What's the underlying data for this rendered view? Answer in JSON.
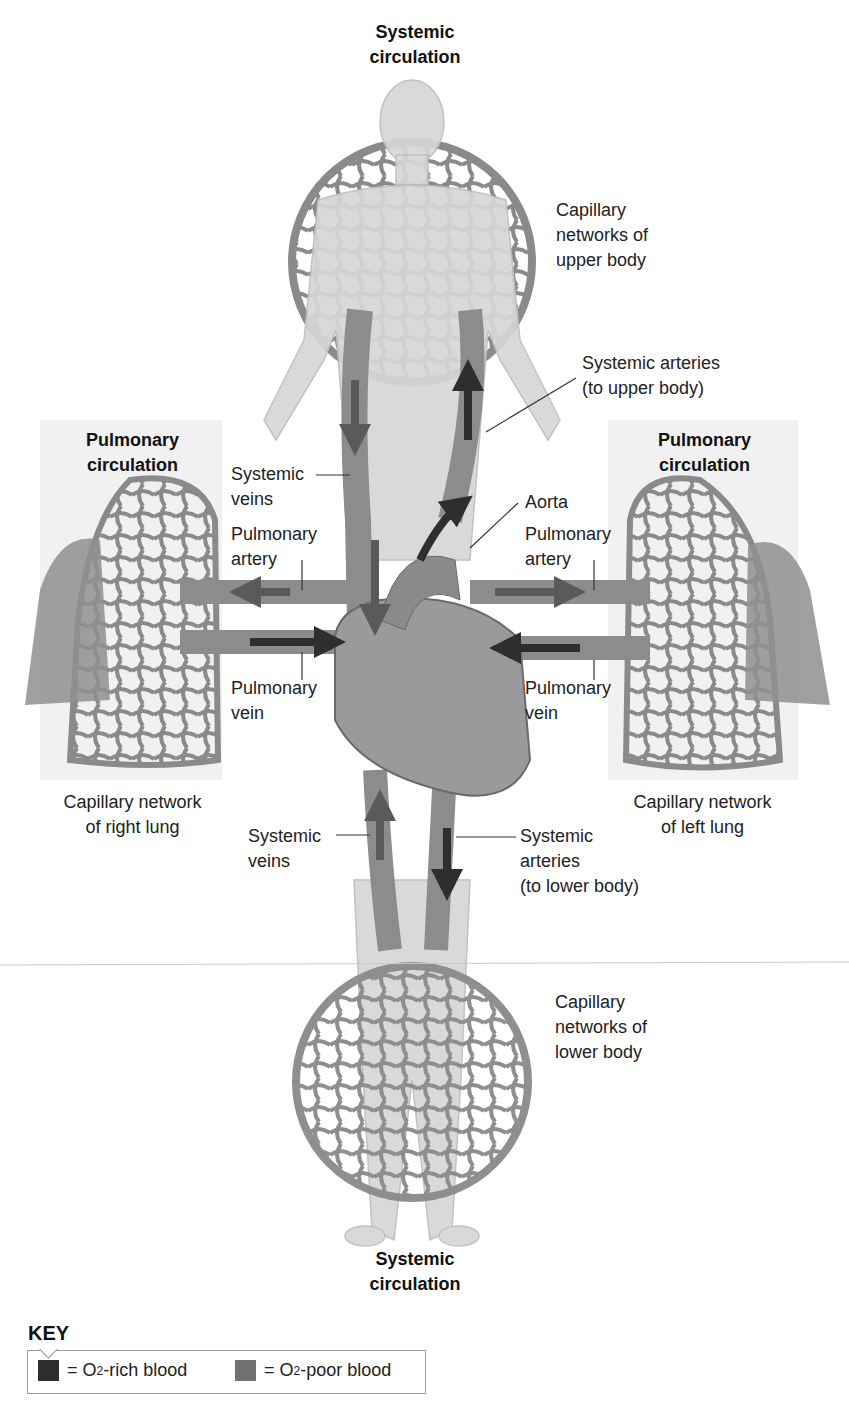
{
  "diagram": {
    "title_top": [
      "Systemic",
      "circulation"
    ],
    "title_bottom": [
      "Systemic",
      "circulation"
    ],
    "title_left": [
      "Pulmonary",
      "circulation"
    ],
    "title_right": [
      "Pulmonary",
      "circulation"
    ],
    "labels": {
      "capillary_upper": [
        "Capillary",
        "networks of",
        "upper body"
      ],
      "systemic_arteries_upper": [
        "Systemic arteries",
        "(to upper body)"
      ],
      "systemic_veins_upper": [
        "Systemic",
        "veins"
      ],
      "aorta": [
        "Aorta"
      ],
      "pulmonary_artery_left": [
        "Pulmonary",
        "artery"
      ],
      "pulmonary_artery_right": [
        "Pulmonary",
        "artery"
      ],
      "pulmonary_vein_left": [
        "Pulmonary",
        "vein"
      ],
      "pulmonary_vein_right": [
        "Pulmonary",
        "vein"
      ],
      "capillary_right_lung": [
        "Capillary network",
        "of right lung"
      ],
      "capillary_left_lung": [
        "Capillary network",
        "of left lung"
      ],
      "systemic_veins_lower": [
        "Systemic",
        "veins"
      ],
      "systemic_arteries_lower": [
        "Systemic",
        "arteries",
        "(to lower body)"
      ],
      "capillary_lower": [
        "Capillary",
        "networks of",
        "lower body"
      ]
    },
    "colors": {
      "o2_rich": "#2e2e2e",
      "o2_poor": "#6e6e6e",
      "vessel": "#8c8c8c",
      "body": "#d4d4d4",
      "panel": "#f1f1f1"
    }
  },
  "key": {
    "title": "KEY",
    "items": [
      {
        "pre": "= O",
        "sub": "2",
        "post": "-rich blood",
        "color": "#2e2e2e"
      },
      {
        "pre": "= O",
        "sub": "2",
        "post": "-poor blood",
        "color": "#707070"
      }
    ]
  }
}
